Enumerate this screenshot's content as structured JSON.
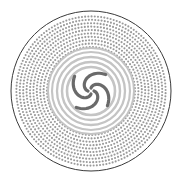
{
  "figure": {
    "title": "",
    "center": [
      91,
      91
    ],
    "radius": 80,
    "colors": {
      "background": "#ffffff",
      "border": "#3a3a3a",
      "outer_dots": "#9a9a9a",
      "rings": "#c4c4c4",
      "spiral_arms": "#6a6a6a"
    },
    "spiral_arm_count": 4
  }
}
